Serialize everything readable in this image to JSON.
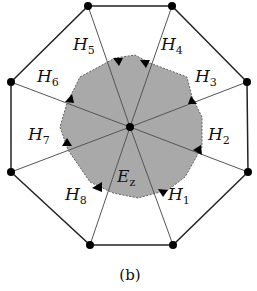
{
  "figure": {
    "caption": "(b)",
    "colors": {
      "edge": "#222222",
      "spoke": "#555555",
      "region_fill": "#a9a9a9",
      "region_border": "#555555",
      "vertex": "#000000"
    },
    "center": {
      "x": 130,
      "y": 127
    },
    "outer_vertices": [
      {
        "x": 88,
        "y": 6
      },
      {
        "x": 172,
        "y": 6
      },
      {
        "x": 247,
        "y": 82
      },
      {
        "x": 248,
        "y": 172
      },
      {
        "x": 173,
        "y": 245
      },
      {
        "x": 90,
        "y": 245
      },
      {
        "x": 11,
        "y": 172
      },
      {
        "x": 11,
        "y": 82
      }
    ],
    "region_label": {
      "main": "E",
      "sub": "z",
      "x": 117,
      "y": 182
    },
    "half_edge_labels": [
      {
        "main": "H",
        "sub": "1",
        "x": 168,
        "y": 200
      },
      {
        "main": "H",
        "sub": "2",
        "x": 208,
        "y": 140
      },
      {
        "main": "H",
        "sub": "3",
        "x": 195,
        "y": 82
      },
      {
        "main": "H",
        "sub": "4",
        "x": 161,
        "y": 50
      },
      {
        "main": "H",
        "sub": "5",
        "x": 73,
        "y": 50
      },
      {
        "main": "H",
        "sub": "6",
        "x": 37,
        "y": 82
      },
      {
        "main": "H",
        "sub": "7",
        "x": 28,
        "y": 140
      },
      {
        "main": "H",
        "sub": "8",
        "x": 65,
        "y": 200
      }
    ]
  }
}
